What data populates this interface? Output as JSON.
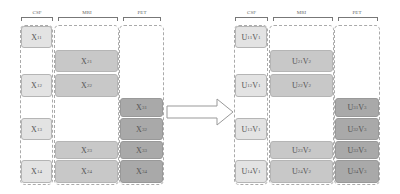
{
  "left": {
    "headers": {
      "csf": "CSF",
      "mri": "MRI",
      "pet": "PET"
    },
    "cells": {
      "csf": [
        {
          "t": "X",
          "s": "11",
          "row": 1
        },
        {
          "t": "X",
          "s": "12",
          "row": 3
        },
        {
          "t": "X",
          "s": "13",
          "row": 5
        },
        {
          "t": "X",
          "s": "14",
          "row": 7
        }
      ],
      "mri": [
        {
          "t": "X",
          "s": "21",
          "row": 2
        },
        {
          "t": "X",
          "s": "22",
          "row": 3
        },
        {
          "t": "X",
          "s": "23",
          "row": 6
        },
        {
          "t": "X",
          "s": "24",
          "row": 7
        }
      ],
      "pet": [
        {
          "t": "X",
          "s": "31",
          "row": 4
        },
        {
          "t": "X",
          "s": "32",
          "row": 5
        },
        {
          "t": "X",
          "s": "33",
          "row": 6
        },
        {
          "t": "X",
          "s": "34",
          "row": 7
        }
      ]
    }
  },
  "right": {
    "headers": {
      "csf": "CSF",
      "mri": "MRI",
      "pet": "PET"
    },
    "cells": {
      "csf": [
        {
          "t": "U",
          "s": "11",
          "v": "1",
          "row": 1
        },
        {
          "t": "U",
          "s": "12",
          "v": "1",
          "row": 3
        },
        {
          "t": "U",
          "s": "13",
          "v": "1",
          "row": 5
        },
        {
          "t": "U",
          "s": "14",
          "v": "1",
          "row": 7
        }
      ],
      "mri": [
        {
          "t": "U",
          "s": "21",
          "v": "2",
          "row": 2
        },
        {
          "t": "U",
          "s": "22",
          "v": "2",
          "row": 3
        },
        {
          "t": "U",
          "s": "23",
          "v": "2",
          "row": 6
        },
        {
          "t": "U",
          "s": "24",
          "v": "2",
          "row": 7
        }
      ],
      "pet": [
        {
          "t": "U",
          "s": "31",
          "v": "3",
          "row": 4
        },
        {
          "t": "U",
          "s": "32",
          "v": "3",
          "row": 5
        },
        {
          "t": "U",
          "s": "33",
          "v": "3",
          "row": 6
        },
        {
          "t": "U",
          "s": "34",
          "v": "3",
          "row": 7
        }
      ]
    }
  },
  "arrow": {
    "direction": "right",
    "icon": "arrow-right-icon"
  },
  "colors": {
    "csf": "#e3e3e3",
    "mri": "#c8c8c8",
    "pet": "#a9a9a9"
  }
}
